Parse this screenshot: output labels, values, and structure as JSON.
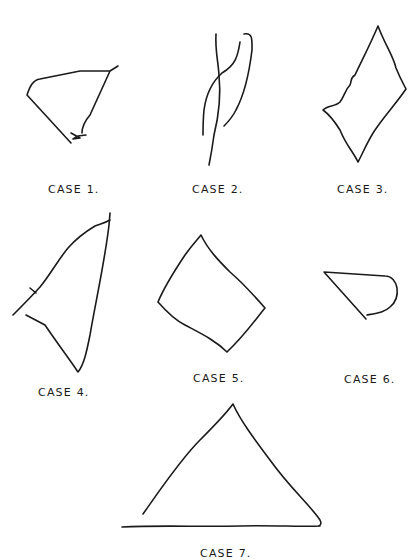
{
  "figure": {
    "cases": [
      {
        "id": 1,
        "label": "CASE 1.",
        "shape": "open quadrilateral with zigzag end"
      },
      {
        "id": 2,
        "label": "CASE 2.",
        "shape": "crossed scribbled lines"
      },
      {
        "id": 3,
        "label": "CASE 3.",
        "shape": "irregular closed rhombus"
      },
      {
        "id": 4,
        "label": "CASE 4.",
        "shape": "open triangle"
      },
      {
        "id": 5,
        "label": "CASE 5.",
        "shape": "closed quadrilateral"
      },
      {
        "id": 6,
        "label": "CASE 6.",
        "shape": "open teardrop shape"
      },
      {
        "id": 7,
        "label": "CASE 7.",
        "shape": "triangle on base line"
      }
    ],
    "stroke_color": "#1a1a1a",
    "background": "#ffffff"
  }
}
